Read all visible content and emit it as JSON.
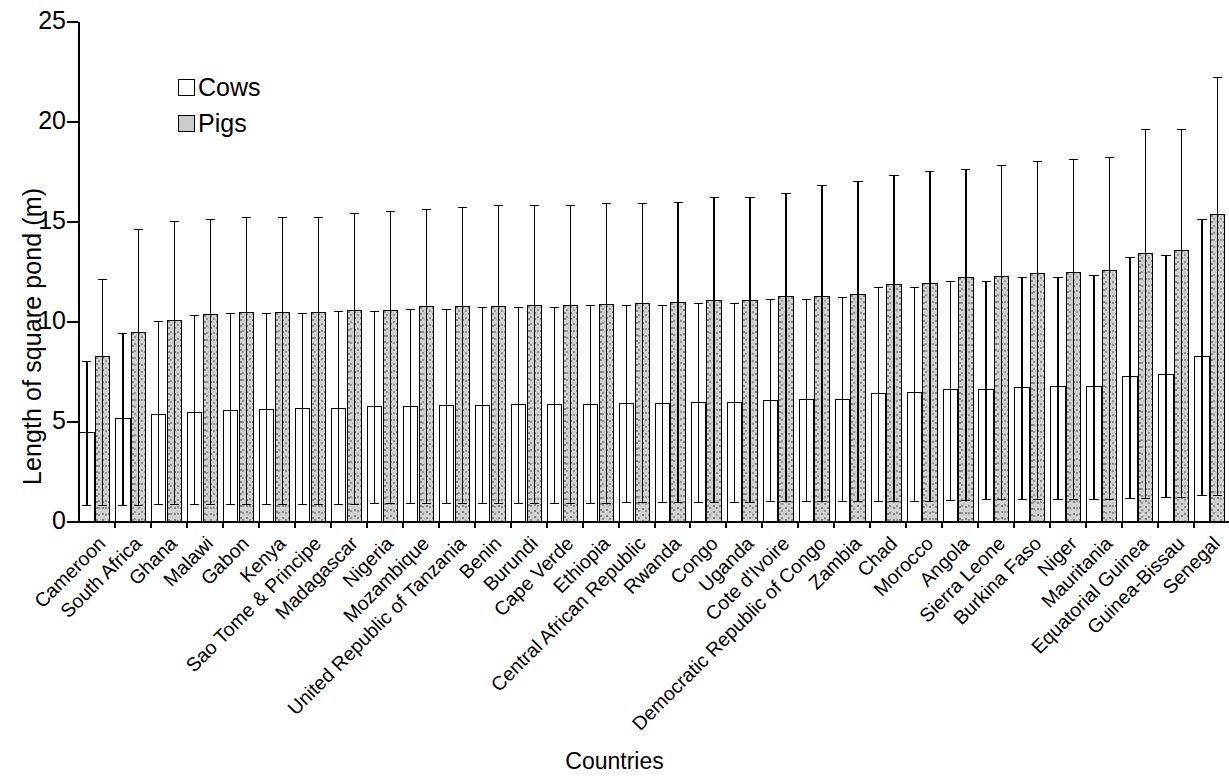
{
  "chart_data": {
    "type": "bar",
    "title": "",
    "xlabel": "Countries",
    "ylabel": "Length of square pond (m)",
    "ylim": [
      0,
      25
    ],
    "yticks": [
      0,
      5,
      10,
      15,
      20,
      25
    ],
    "grid": false,
    "legend_position": "top-left",
    "orientation": "vertical",
    "error_bars": "asymmetric (min-max range)",
    "categories": [
      "Cameroon",
      "South Africa",
      "Ghana",
      "Malawi",
      "Gabon",
      "Kenya",
      "Sao Tome & Principe",
      "Madagascar",
      "Nigeria",
      "Mozambique",
      "United Republic of Tanzania",
      "Benin",
      "Burundi",
      "Cape Verde",
      "Ethiopia",
      "Central African Republic",
      "Rwanda",
      "Congo",
      "Uganda",
      "Cote d'Ivoire",
      "Democratic Republic of Congo",
      "Zambia",
      "Chad",
      "Morocco",
      "Angola",
      "Sierra Leone",
      "Burkina Faso",
      "Niger",
      "Mauritania",
      "Equatorial Guinea",
      "Guinea-Bissau",
      "Senegal"
    ],
    "series": [
      {
        "name": "Cows",
        "color": "#ffffff",
        "values": [
          4.5,
          5.2,
          5.4,
          5.5,
          5.6,
          5.65,
          5.7,
          5.7,
          5.8,
          5.8,
          5.85,
          5.85,
          5.9,
          5.9,
          5.9,
          5.95,
          5.95,
          6.0,
          6.0,
          6.1,
          6.15,
          6.15,
          6.45,
          6.5,
          6.65,
          6.65,
          6.75,
          6.8,
          6.8,
          7.3,
          7.4,
          8.3
        ],
        "err_low": [
          0.8,
          0.8,
          0.85,
          0.85,
          0.85,
          0.85,
          0.85,
          0.85,
          0.9,
          0.9,
          0.9,
          0.9,
          0.9,
          0.9,
          0.9,
          0.95,
          0.95,
          0.95,
          0.95,
          1.0,
          1.0,
          1.0,
          1.0,
          1.0,
          1.05,
          1.1,
          1.1,
          1.1,
          1.1,
          1.15,
          1.2,
          1.3
        ],
        "err_high": [
          8.0,
          9.4,
          10.0,
          10.3,
          10.4,
          10.4,
          10.4,
          10.5,
          10.5,
          10.6,
          10.6,
          10.7,
          10.7,
          10.7,
          10.8,
          10.8,
          10.8,
          10.9,
          10.9,
          11.1,
          11.1,
          11.2,
          11.7,
          11.7,
          12.0,
          12.0,
          12.2,
          12.2,
          12.3,
          13.2,
          13.3,
          15.1
        ]
      },
      {
        "name": "Pigs",
        "color": "#d2d2d2",
        "values": [
          8.3,
          9.5,
          10.1,
          10.4,
          10.5,
          10.5,
          10.5,
          10.6,
          10.6,
          10.8,
          10.8,
          10.8,
          10.85,
          10.85,
          10.9,
          10.95,
          11.0,
          11.1,
          11.1,
          11.3,
          11.3,
          11.4,
          11.9,
          11.95,
          12.25,
          12.3,
          12.45,
          12.5,
          12.6,
          13.45,
          13.6,
          15.4
        ],
        "err_low": [
          0.8,
          0.8,
          0.85,
          0.85,
          0.85,
          0.85,
          0.85,
          0.85,
          0.9,
          0.9,
          0.9,
          0.9,
          0.9,
          0.9,
          0.9,
          0.95,
          0.95,
          0.95,
          0.95,
          1.0,
          1.0,
          1.0,
          1.0,
          1.0,
          1.05,
          1.1,
          1.1,
          1.1,
          1.1,
          1.15,
          1.2,
          1.3
        ],
        "err_high": [
          12.1,
          14.6,
          15.0,
          15.1,
          15.2,
          15.2,
          15.2,
          15.4,
          15.5,
          15.6,
          15.7,
          15.8,
          15.8,
          15.8,
          15.9,
          15.9,
          15.95,
          16.2,
          16.2,
          16.4,
          16.8,
          17.0,
          17.3,
          17.5,
          17.6,
          17.8,
          18.0,
          18.1,
          18.2,
          19.6,
          19.6,
          22.2
        ]
      }
    ]
  },
  "legend": {
    "items": [
      {
        "label": "Cows",
        "swatch": "white-square"
      },
      {
        "label": "Pigs",
        "swatch": "gray-square"
      }
    ]
  },
  "axes": {
    "y_title": "Length of square pond (m)",
    "x_title": "Countries",
    "y_tick_labels": [
      "0",
      "5",
      "10",
      "15",
      "20",
      "25"
    ]
  }
}
